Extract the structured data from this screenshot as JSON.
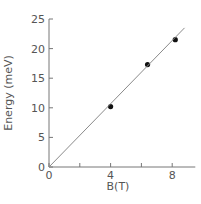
{
  "chart_data": {
    "type": "scatter",
    "title": "",
    "xlabel": "B(T)",
    "ylabel": "Energy (meV)",
    "xlim": [
      0,
      9.5
    ],
    "ylim": [
      0,
      25
    ],
    "x_ticks": [
      0,
      2,
      4,
      6,
      8
    ],
    "x_tick_labels": [
      "0",
      "",
      "4",
      "",
      "8"
    ],
    "y_ticks": [
      0,
      5,
      10,
      15,
      20,
      25
    ],
    "y_tick_labels": [
      "0",
      "5",
      "10",
      "15",
      "20",
      "25"
    ],
    "grid": false,
    "legend": null,
    "series": [
      {
        "name": "measured",
        "kind": "points",
        "x": [
          4.0,
          6.4,
          8.2
        ],
        "y": [
          10.2,
          17.3,
          21.5
        ]
      },
      {
        "name": "linear fit",
        "kind": "line",
        "x": [
          0,
          8.8
        ],
        "y": [
          0,
          23.5
        ]
      }
    ]
  }
}
